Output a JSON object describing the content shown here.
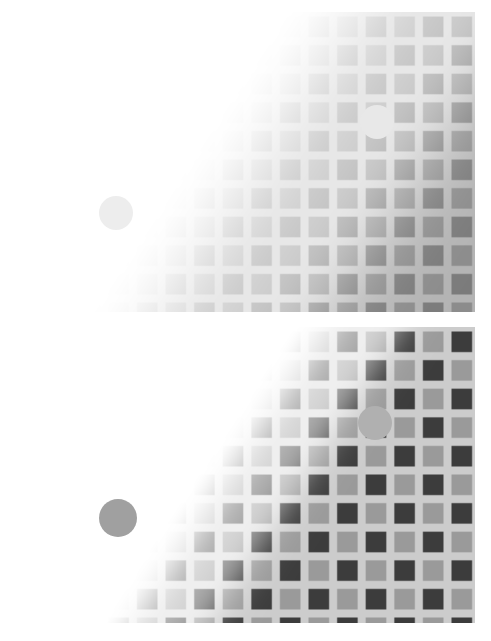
{
  "figure": {
    "width": 491,
    "height": 641,
    "background": "#ffffff",
    "type": "visual-illusion-figure",
    "panel_count": 2
  },
  "chart_data": {
    "type": "heatmap",
    "title": "",
    "subtitle": "",
    "xlabel": "",
    "ylabel": "",
    "grid": true,
    "legend": null,
    "panels": [
      {
        "name": "panel-top",
        "index": 0,
        "x": 18,
        "y": 12,
        "width": 457,
        "height": 300,
        "rows": 10,
        "cols": 16,
        "pitch": 28.6,
        "tile_fraction": 0.72,
        "pattern": "uniform-tiles-on-light-ground",
        "tile_color_dark": "#7b7b7b",
        "tile_color_light": "#8c8c8c",
        "gap_color": "#b3b3b3",
        "background": "#ffffff",
        "ramp": {
          "kind": "diagonal-luminance-ramp",
          "from_corner": "top-left",
          "to_corner": "bottom-right",
          "bright_value": 1.0,
          "dark_value": 0.0,
          "soft_edge": 0.22,
          "offset": -0.12,
          "angle_deg": 33
        },
        "discs": [
          {
            "name": "disc-top-right",
            "cx": 377,
            "cy": 122,
            "r": 17,
            "fill": "#e8e8e8",
            "label": ""
          },
          {
            "name": "disc-top-left",
            "cx": 116,
            "cy": 213,
            "r": 17,
            "fill": "#ededed",
            "label": ""
          }
        ]
      },
      {
        "name": "panel-bottom",
        "index": 1,
        "x": 18,
        "y": 327,
        "width": 457,
        "height": 296,
        "rows": 10,
        "cols": 16,
        "pitch": 28.6,
        "tile_fraction": 0.72,
        "pattern": "checkerboard-tiles",
        "tile_color_dark": "#3c3c3c",
        "tile_color_light": "#9a9a9a",
        "gap_color": "#cccccc",
        "background": "#ffffff",
        "ramp": {
          "kind": "diagonal-luminance-ramp",
          "from_corner": "top-left",
          "to_corner": "bottom-right",
          "bright_value": 1.0,
          "dark_value": 0.0,
          "soft_edge": 0.1,
          "offset": -0.02,
          "angle_deg": 33
        },
        "discs": [
          {
            "name": "disc-bottom-right",
            "cx": 375,
            "cy": 423,
            "r": 17,
            "fill": "#b0b0b0",
            "label": ""
          },
          {
            "name": "disc-bottom-left",
            "cx": 118,
            "cy": 518,
            "r": 19,
            "fill": "#a0a0a0",
            "label": ""
          }
        ]
      }
    ]
  }
}
